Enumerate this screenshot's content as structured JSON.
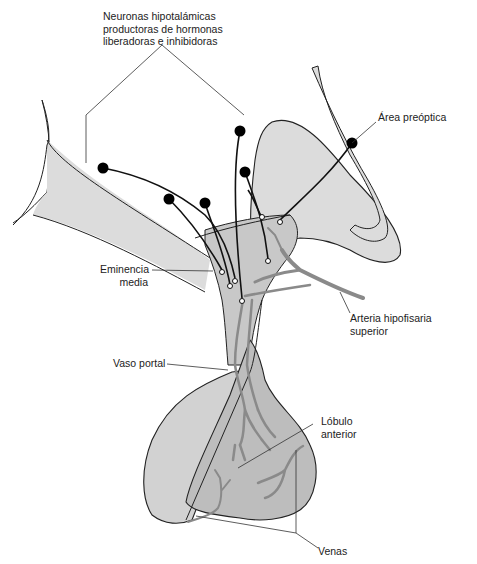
{
  "labels": {
    "neurons": {
      "line1": "Neuronas hipotalámicas",
      "line2": "productoras de hormonas",
      "line3": "liberadoras e inhibidoras"
    },
    "preoptic": "Área preóptica",
    "median_eminence": {
      "line1": "Eminencia",
      "line2": "media"
    },
    "superior_artery": {
      "line1": "Arteria hipofisaria",
      "line2": "superior"
    },
    "portal_vessel": "Vaso portal",
    "anterior_lobe": {
      "line1": "Lóbulo",
      "line2": "anterior"
    },
    "veins": "Venas"
  },
  "colors": {
    "tissue_light": "#dcdcdc",
    "tissue_mid": "#c8c8c8",
    "vessel": "#8a8a8a",
    "outline": "#222222",
    "neuron": "#000000"
  }
}
